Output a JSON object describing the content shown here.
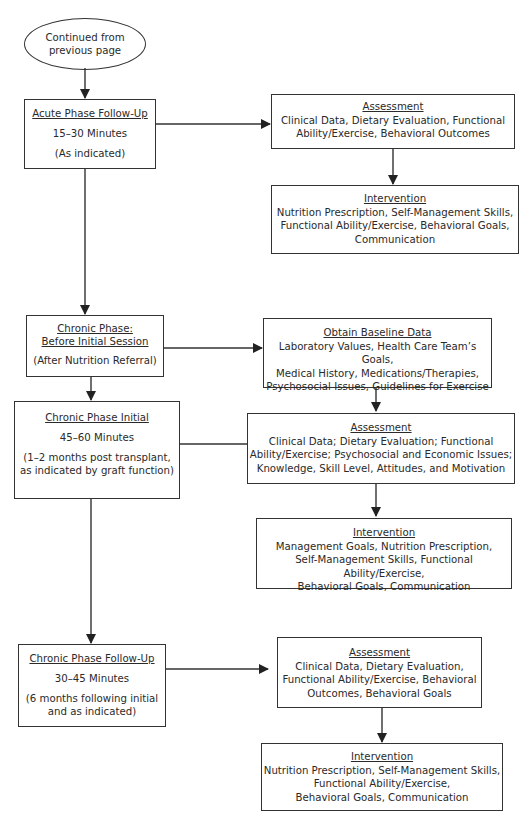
{
  "start": {
    "lines": [
      "Continued from",
      "previous page"
    ]
  },
  "acute_followup": {
    "title": "Acute Phase Follow-Up",
    "duration": "15–30 Minutes",
    "note": "(As indicated)",
    "assessment": {
      "title": "Assessment",
      "lines": [
        "Clinical Data, Dietary Evaluation, Functional",
        "Ability/Exercise, Behavioral Outcomes"
      ]
    },
    "intervention": {
      "title": "Intervention",
      "lines": [
        "Nutrition Prescription, Self-Management Skills,",
        "Functional Ability/Exercise, Behavioral Goals,",
        "Communication"
      ]
    }
  },
  "chronic_before": {
    "title_lines": [
      "Chronic Phase:",
      "Before Initial Session"
    ],
    "note": "(After Nutrition Referral)",
    "baseline": {
      "title": "Obtain Baseline Data",
      "lines": [
        "Laboratory Values, Health Care Team’s Goals,",
        "Medical History, Medications/Therapies,",
        "Psychosocial Issues, Guidelines for Exercise"
      ]
    }
  },
  "chronic_initial": {
    "title": "Chronic Phase Initial",
    "duration": "45–60 Minutes",
    "note_lines": [
      "(1–2 months post transplant,",
      "as indicated by graft function)"
    ],
    "assessment": {
      "title": "Assessment",
      "lines": [
        "Clinical Data; Dietary Evaluation; Functional",
        "Ability/Exercise; Psychosocial and Economic Issues;",
        "Knowledge, Skill Level, Attitudes, and Motivation"
      ]
    },
    "intervention": {
      "title": "Intervention",
      "lines": [
        "Management Goals, Nutrition Prescription,",
        "Self-Management Skills, Functional Ability/Exercise,",
        "Behavioral Goals, Communication"
      ]
    }
  },
  "chronic_followup": {
    "title": "Chronic Phase Follow-Up",
    "duration": "30–45 Minutes",
    "note_lines": [
      "(6 months following initial",
      "and as indicated)"
    ],
    "assessment": {
      "title": "Assessment",
      "lines": [
        "Clinical Data, Dietary Evaluation,",
        "Functional Ability/Exercise, Behavioral",
        "Outcomes, Behavioral Goals"
      ]
    },
    "intervention": {
      "title": "Intervention",
      "lines": [
        "Nutrition Prescription, Self-Management Skills,",
        "Functional Ability/Exercise,",
        "Behavioral Goals, Communication"
      ]
    }
  },
  "colors": {
    "stroke": "#333333",
    "text": "#2a2a2a",
    "background": "#ffffff"
  }
}
